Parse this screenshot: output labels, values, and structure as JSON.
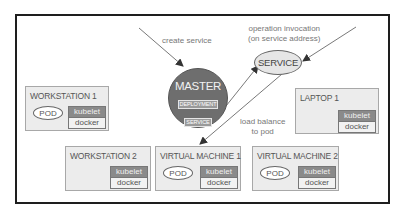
{
  "diagram": {
    "master": {
      "title": "MASTER",
      "tags": [
        "DEPLOYMENT",
        "SERVICE"
      ]
    },
    "service": {
      "label": "SERVICE"
    },
    "annotations": {
      "create_service": "create service",
      "invocation_line1": "operation invocation",
      "invocation_line2": "(on service address)",
      "load_balance_line1": "load balance",
      "load_balance_line2": "to pod"
    },
    "nodes": [
      {
        "id": "workstation-1",
        "title": "WORKSTATION 1",
        "has_pod": true,
        "pod_label": "POD",
        "kubelet": "kubelet",
        "docker": "docker"
      },
      {
        "id": "laptop-1",
        "title": "LAPTOP 1",
        "has_pod": false,
        "kubelet": "kubelet",
        "docker": "docker"
      },
      {
        "id": "workstation-2",
        "title": "WORKSTATION 2",
        "has_pod": false,
        "kubelet": "kubelet",
        "docker": "docker"
      },
      {
        "id": "virtual-machine-1",
        "title": "VIRTUAL MACHINE 1",
        "has_pod": true,
        "pod_label": "POD",
        "kubelet": "kubelet",
        "docker": "docker"
      },
      {
        "id": "virtual-machine-2",
        "title": "VIRTUAL MACHINE 2",
        "has_pod": true,
        "pod_label": "POD",
        "kubelet": "kubelet",
        "docker": "docker"
      }
    ],
    "colors": {
      "frame": "#1e1e1e",
      "node_fill": "#ececec",
      "master_fill": "#6e6e6e",
      "kubelet_fill": "#8a8a8a",
      "arrow": "#333333"
    }
  }
}
